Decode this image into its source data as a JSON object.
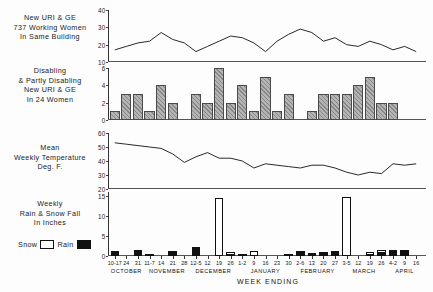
{
  "figure": {
    "xaxis_title": "WEEK ENDING",
    "months": [
      "OCTOBER",
      "NOVEMBER",
      "DECEMBER",
      "JANUARY",
      "FEBRUARY",
      "MARCH",
      "APRIL"
    ],
    "week_labels": [
      "10-17",
      "24",
      "31",
      "11-7",
      "14",
      "21",
      "28",
      "12-5",
      "12",
      "19",
      "26",
      "1-2",
      "9",
      "16",
      "23",
      "30",
      "2-6",
      "13",
      "20",
      "27",
      "3-5",
      "12",
      "19",
      "26",
      "4-2",
      "9",
      "16"
    ],
    "legend": {
      "snow_label": "Snow",
      "rain_label": "Rain",
      "snow_color": "#ffffff",
      "rain_color": "#111111"
    }
  },
  "panels": {
    "uri_ge": {
      "title_lines": [
        "New URI & GE",
        "737 Working Women",
        "In Same Building"
      ],
      "yticks": [
        "40",
        "30",
        "20",
        "10"
      ]
    },
    "disabling": {
      "title_lines": [
        "Disabling",
        "& Partly Disabling",
        "New URI & GE",
        "In 24 Women"
      ],
      "yticks": [
        "6",
        "4",
        "2",
        "0"
      ]
    },
    "temperature": {
      "title_lines": [
        "Mean",
        "Weekly Temperature",
        "Deg. F."
      ],
      "yticks": [
        "60",
        "50",
        "40",
        "30",
        "20"
      ]
    },
    "precipitation": {
      "title_lines": [
        "Weekly",
        "Rain & Snow Fall",
        "In Inches"
      ],
      "yticks": [
        "15",
        "10",
        "5",
        "0"
      ]
    }
  },
  "chart_data": [
    {
      "type": "line",
      "title": "New URI & GE 737 Working Women In Same Building",
      "xlabel": "WEEK ENDING",
      "ylabel": "New URI & GE cases",
      "ylim": [
        10,
        40
      ],
      "yticks": [
        10,
        20,
        30,
        40
      ],
      "grid": false,
      "x": [
        "10-17",
        "24",
        "31",
        "11-7",
        "14",
        "21",
        "28",
        "12-5",
        "12",
        "19",
        "26",
        "1-2",
        "9",
        "16",
        "23",
        "30",
        "2-6",
        "13",
        "20",
        "27",
        "3-5",
        "12",
        "19",
        "26",
        "4-2",
        "9",
        "16"
      ],
      "values": [
        17,
        19,
        21,
        22,
        27,
        23,
        21,
        16,
        19,
        22,
        25,
        24,
        21,
        16,
        22,
        26,
        29,
        27,
        22,
        24,
        20,
        19,
        22,
        20,
        17,
        19,
        16
      ]
    },
    {
      "type": "bar",
      "title": "Disabling & Partly Disabling New URI & GE In 24 Women",
      "xlabel": "WEEK ENDING",
      "ylabel": "Cases",
      "ylim": [
        0,
        6
      ],
      "yticks": [
        0,
        2,
        4,
        6
      ],
      "grid": false,
      "categories": [
        "10-17",
        "24",
        "31",
        "11-7",
        "14",
        "21",
        "28",
        "12-5",
        "12",
        "19",
        "26",
        "1-2",
        "9",
        "16",
        "23",
        "30",
        "2-6",
        "13",
        "20",
        "27",
        "3-5",
        "12",
        "19",
        "26",
        "4-2",
        "9",
        "16"
      ],
      "values": [
        1,
        3,
        3,
        1,
        4,
        2,
        0,
        3,
        2,
        6,
        2,
        4,
        1,
        5,
        1,
        3,
        0,
        1,
        3,
        3,
        3,
        4,
        5,
        2,
        2,
        0,
        0
      ]
    },
    {
      "type": "line",
      "title": "Mean Weekly Temperature Deg. F.",
      "xlabel": "WEEK ENDING",
      "ylabel": "Deg. F.",
      "ylim": [
        20,
        60
      ],
      "yticks": [
        20,
        30,
        40,
        50,
        60
      ],
      "grid": false,
      "x": [
        "10-17",
        "24",
        "31",
        "11-7",
        "14",
        "21",
        "28",
        "12-5",
        "12",
        "19",
        "26",
        "1-2",
        "9",
        "16",
        "23",
        "30",
        "2-6",
        "13",
        "20",
        "27",
        "3-5",
        "12",
        "19",
        "26",
        "4-2",
        "9",
        "16"
      ],
      "values": [
        53,
        52,
        51,
        50,
        49,
        45,
        39,
        43,
        46,
        42,
        42,
        40,
        35,
        38,
        37,
        36,
        35,
        37,
        37,
        35,
        32,
        30,
        32,
        31,
        38,
        37,
        38
      ]
    },
    {
      "type": "bar",
      "title": "Weekly Rain & Snow Fall In Inches",
      "xlabel": "WEEK ENDING",
      "ylabel": "Inches",
      "ylim": [
        0,
        16
      ],
      "yticks": [
        0,
        5,
        10,
        15
      ],
      "grid": false,
      "categories": [
        "10-17",
        "24",
        "31",
        "11-7",
        "14",
        "21",
        "28",
        "12-5",
        "12",
        "19",
        "26",
        "1-2",
        "9",
        "16",
        "23",
        "30",
        "2-6",
        "13",
        "20",
        "27",
        "3-5",
        "12",
        "19",
        "26",
        "4-2",
        "9",
        "16"
      ],
      "series": [
        {
          "name": "Rain",
          "color": "#111111",
          "values": [
            1.3,
            0,
            1.5,
            0.6,
            0,
            1.3,
            0,
            2.3,
            0,
            0,
            0.6,
            0.5,
            0,
            0,
            0,
            0.3,
            1.3,
            0.8,
            1.0,
            1.3,
            0,
            0,
            0.6,
            1.0,
            1.5,
            1.6,
            0
          ]
        },
        {
          "name": "Snow",
          "color": "#ffffff",
          "values": [
            0,
            0,
            0,
            0,
            0,
            0,
            0,
            0,
            0,
            14.6,
            1.0,
            0,
            1.3,
            0,
            0,
            0,
            0,
            0,
            0,
            0,
            14.8,
            0,
            1.0,
            1.5,
            0,
            0,
            0
          ]
        }
      ]
    }
  ]
}
